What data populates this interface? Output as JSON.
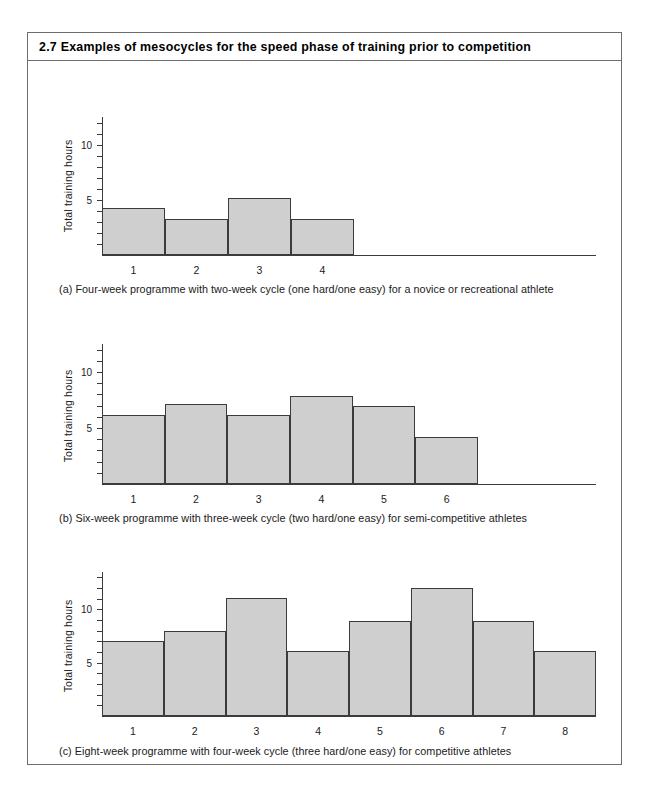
{
  "figure": {
    "number": "2.7",
    "title": "2.7 Examples of mesocycles for the speed phase of training prior to competition"
  },
  "chart_data": [
    {
      "id": "a",
      "type": "bar",
      "title": "",
      "xlabel": "",
      "ylabel": "Total training hours",
      "categories": [
        "1",
        "2",
        "3",
        "4"
      ],
      "values": [
        4.3,
        3.3,
        5.2,
        3.3
      ],
      "ylim": [
        0,
        12.5
      ],
      "yticks": [
        1,
        2,
        3,
        4,
        5,
        6,
        7,
        8,
        9,
        10,
        11,
        12
      ],
      "ytick_labels": {
        "5": "5",
        "10": "10"
      },
      "grid": false,
      "legend": "none",
      "bar_fill": "#cfcfcf",
      "bar_stroke": "#3b3b3b",
      "caption": "(a) Four-week programme with two-week cycle (one hard/one easy) for a novice or recreational athlete"
    },
    {
      "id": "b",
      "type": "bar",
      "title": "",
      "xlabel": "",
      "ylabel": "Total training hours",
      "categories": [
        "1",
        "2",
        "3",
        "4",
        "5",
        "6"
      ],
      "values": [
        6.2,
        7.1,
        6.2,
        7.9,
        7.0,
        4.2
      ],
      "ylim": [
        0,
        12.5
      ],
      "yticks": [
        1,
        2,
        3,
        4,
        5,
        6,
        7,
        8,
        9,
        10,
        11,
        12
      ],
      "ytick_labels": {
        "5": "5",
        "10": "10"
      },
      "grid": false,
      "legend": "none",
      "bar_fill": "#cfcfcf",
      "bar_stroke": "#3b3b3b",
      "caption": "(b) Six-week programme with three-week cycle (two hard/one easy) for semi-competitive athletes"
    },
    {
      "id": "c",
      "type": "bar",
      "title": "",
      "xlabel": "",
      "ylabel": "Total training hours",
      "categories": [
        "1",
        "2",
        "3",
        "4",
        "5",
        "6",
        "7",
        "8"
      ],
      "values": [
        7.0,
        8.0,
        11.1,
        6.1,
        8.9,
        12.0,
        8.9,
        6.1
      ],
      "ylim": [
        0,
        13.5
      ],
      "yticks": [
        1,
        2,
        3,
        4,
        5,
        6,
        7,
        8,
        9,
        10,
        11,
        12,
        13
      ],
      "ytick_labels": {
        "5": "5",
        "10": "10"
      },
      "grid": false,
      "legend": "none",
      "bar_fill": "#cfcfcf",
      "bar_stroke": "#3b3b3b",
      "caption": "(c) Eight-week programme with four-week cycle (three hard/one easy) for competitive athletes"
    }
  ]
}
